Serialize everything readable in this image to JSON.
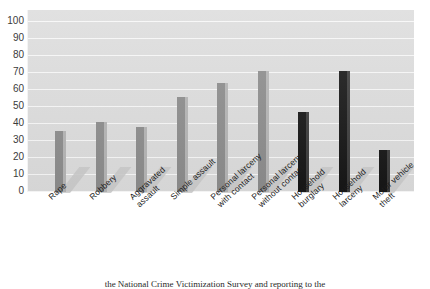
{
  "chart_data": {
    "type": "bar",
    "title": "",
    "xlabel": "",
    "ylabel": "",
    "ylim": [
      0,
      100
    ],
    "ytick_step": 10,
    "yticks": [
      "100",
      "90",
      "80",
      "70",
      "60",
      "50",
      "40",
      "30",
      "20",
      "10",
      "0"
    ],
    "grid": true,
    "legend": "none",
    "categories": [
      "Rape",
      "Robbery",
      "Aggravated assault",
      "Simple assault",
      "Personal larceny with contact",
      "Personal larceny without contact",
      "Household burglary",
      "Household larceny",
      "Motor vehicle theft"
    ],
    "category_lines": [
      [
        "Rape"
      ],
      [
        "Robbery"
      ],
      [
        "Aggravated",
        "assault"
      ],
      [
        "Simple assault"
      ],
      [
        "Personal larceny",
        "with contact"
      ],
      [
        "Personal larceny",
        "without contact"
      ],
      [
        "Household",
        "burglary"
      ],
      [
        "Household",
        "larceny"
      ],
      [
        "Motor vehicle",
        "theft"
      ]
    ],
    "values": [
      36,
      41,
      38,
      56,
      64,
      71,
      47,
      71,
      25
    ],
    "bar_colors": [
      "#8c8c8c",
      "#8c8c8c",
      "#8c8c8c",
      "#8c8c8c",
      "#8c8c8c",
      "#8c8c8c",
      "#161616",
      "#161616",
      "#161616"
    ],
    "bar_groups": [
      "personal",
      "personal",
      "personal",
      "personal",
      "personal",
      "personal",
      "household",
      "household",
      "household"
    ]
  },
  "style": {
    "plot_background": "#dcdcdc",
    "gridline_color": "#f7f7f7",
    "page_background": "#ffffff",
    "personal_crime_color": "#8c8c8c",
    "household_crime_color": "#161616"
  },
  "caption": {
    "text": "the National Crime Victimization Survey and reporting to the"
  }
}
